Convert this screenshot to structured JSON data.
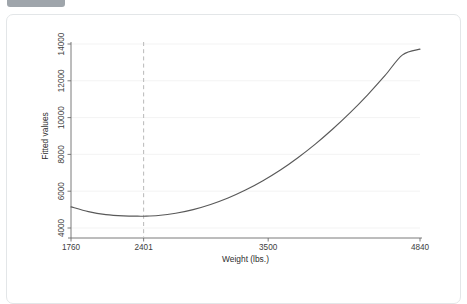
{
  "header": {
    "badge_label": "",
    "title": ""
  },
  "chart_data": {
    "type": "line",
    "title": "",
    "xlabel": "Weight (lbs.)",
    "ylabel": "Fitted values",
    "xlim": [
      1760,
      4840
    ],
    "ylim": [
      4000,
      14000
    ],
    "xticks": [
      1760,
      2401,
      3500,
      4840
    ],
    "xtick_labels": [
      "1760",
      "2401",
      "3500",
      "4840"
    ],
    "yticks": [
      4000,
      6000,
      8000,
      10000,
      12000,
      14000
    ],
    "ytick_labels": [
      "4000",
      "6000",
      "8000",
      "10000",
      "12000",
      "14000"
    ],
    "grid": true,
    "legend": false,
    "annotations": [
      {
        "type": "vline",
        "name": "turning-point-reference-line",
        "x": 2401,
        "label": "2401",
        "style": "dashed"
      }
    ],
    "series": [
      {
        "name": "Fitted values",
        "color": "#595959",
        "x": [
          1760,
          1914,
          2068,
          2222,
          2376,
          2401,
          2530,
          2684,
          2838,
          2992,
          3146,
          3300,
          3454,
          3608,
          3762,
          3916,
          4070,
          4224,
          4378,
          4532,
          4686,
          4840
        ],
        "y": [
          5150,
          4890,
          4730,
          4660,
          4640,
          4640,
          4680,
          4800,
          5000,
          5280,
          5630,
          6060,
          6570,
          7150,
          7820,
          8560,
          9380,
          10270,
          11240,
          12290,
          13410,
          13720
        ]
      }
    ]
  }
}
